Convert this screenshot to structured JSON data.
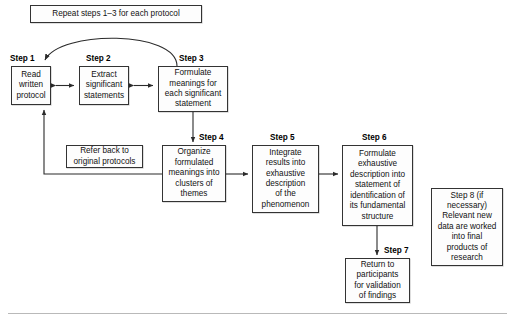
{
  "diagram": {
    "repeat_banner": "Repeat steps 1–3 for each protocol",
    "refer_back": "Refer back to\noriginal protocols",
    "steps": [
      {
        "id": "step1",
        "label": "Step 1",
        "text": "Read\nwritten\nprotocol"
      },
      {
        "id": "step2",
        "label": "Step 2",
        "text": "Extract\nsignificant\nstatements"
      },
      {
        "id": "step3",
        "label": "Step 3",
        "text": "Formulate\nmeanings for\neach significant\nstatement"
      },
      {
        "id": "step4",
        "label": "Step 4",
        "text": "Organize\nformulated\nmeanings into\nclusters of\nthemes"
      },
      {
        "id": "step5",
        "label": "Step 5",
        "text": "Integrate\nresults into\nexhaustive\ndescription\nof the\nphenomenon"
      },
      {
        "id": "step6",
        "label": "Step 6",
        "text": "Formulate\nexhaustive\ndescription into\nstatement of\nidentification of\nits fundamental\nstructure"
      },
      {
        "id": "step7",
        "label": "Step 7",
        "text": "Return to\nparticipants\nfor validation\nof findings"
      },
      {
        "id": "step8",
        "label": "",
        "text": "Step 8 (if\nnecessary)\nRelevant new\ndata are worked\ninto final\nproducts of\nresearch"
      }
    ]
  },
  "colors": {
    "box_border": "#333333",
    "box_fill": "#fdfdfd",
    "wire": "#2b2b2b",
    "text": "#111111",
    "rule": "#b9b9b9"
  }
}
